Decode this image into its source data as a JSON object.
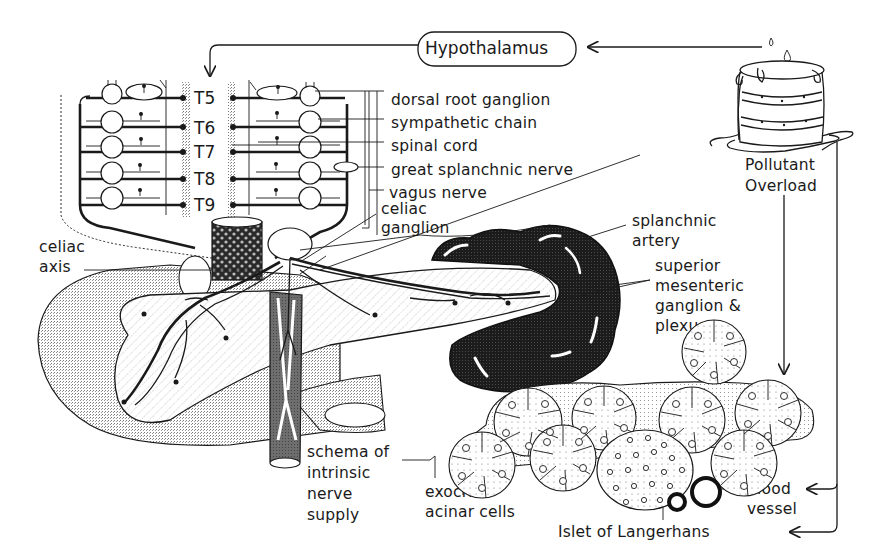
{
  "diagram": {
    "colors": {
      "ink": "#1a1a1a",
      "background": "#ffffff",
      "stipple_light": "#d9d9d9",
      "stipple_medium": "#b8b8b8",
      "dark_mass": "#222222"
    },
    "nodes": {
      "hypothalamus": "Hypothalamus",
      "pollutant_overload_line1": "Pollutant",
      "pollutant_overload_line2": "Overload"
    },
    "spinal_segments": [
      "T5",
      "T6",
      "T7",
      "T8",
      "T9"
    ],
    "labels": {
      "dorsal_root_ganglion": "dorsal root ganglion",
      "sympathetic_chain": "sympathetic chain",
      "spinal_cord": "spinal cord",
      "great_splanchnic_nerve": "great splanchnic nerve",
      "vagus_nerve": "vagus nerve",
      "celiac_ganglion_line1": "celiac",
      "celiac_ganglion_line2": "ganglion",
      "celiac_axis_line1": "celiac",
      "celiac_axis_line2": "axis",
      "splanchnic_artery_line1": "splanchnic",
      "splanchnic_artery_line2": "artery",
      "sup_mesenteric_line1": "superior",
      "sup_mesenteric_line2": "mesenteric",
      "sup_mesenteric_line3": "ganglion &",
      "sup_mesenteric_line4": "plexus",
      "schema_line1": "schema of",
      "schema_line2": "intrinsic",
      "schema_line3": "nerve",
      "schema_line4": "supply",
      "exocrine_line1": "exocrine",
      "exocrine_line2": "acinar cells",
      "blood_vessel_line1": "blood",
      "blood_vessel_line2": "vessel",
      "islet": "Islet of Langerhans"
    },
    "icons": {
      "barrel": "overflowing-barrel-icon",
      "drop": "droplet-icon"
    }
  }
}
